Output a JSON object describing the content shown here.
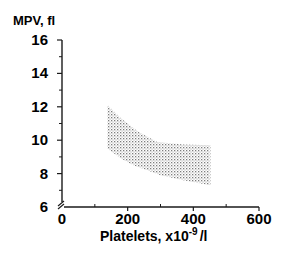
{
  "chart_data": {
    "type": "area",
    "title": "",
    "xlabel": "Platelets, x10⁻⁹/l",
    "xlabel_main": "Platelets, x10",
    "xlabel_sup": "-9",
    "xlabel_tail": "/l",
    "ylabel": "MPV, fl",
    "xlim": [
      0,
      600
    ],
    "ylim": [
      6,
      16
    ],
    "x_ticks": [
      0,
      200,
      400,
      600
    ],
    "x_tick_labels": [
      "0",
      "200",
      "400",
      "600"
    ],
    "x_minor_ticks": [
      100,
      300,
      500
    ],
    "y_ticks": [
      6,
      8,
      10,
      12,
      14,
      16
    ],
    "y_tick_labels": [
      "6",
      "8",
      "10",
      "12",
      "14",
      "16"
    ],
    "y_minor_ticks": [
      7,
      9,
      11,
      13,
      15
    ],
    "axis_break": true,
    "grid": false,
    "legend": null,
    "series": [
      {
        "name": "Normal range band (upper bound)",
        "x": [
          138,
          180,
          232,
          290,
          370,
          452
        ],
        "values": [
          12.1,
          11.3,
          10.5,
          9.9,
          9.75,
          9.7
        ]
      },
      {
        "name": "Normal range band (lower bound)",
        "x": [
          138,
          180,
          217,
          260,
          300,
          370,
          452
        ],
        "values": [
          9.5,
          8.9,
          8.5,
          8.2,
          7.9,
          7.6,
          7.3
        ]
      }
    ],
    "fill": "stippled",
    "fill_color": "#8a8a8a"
  }
}
